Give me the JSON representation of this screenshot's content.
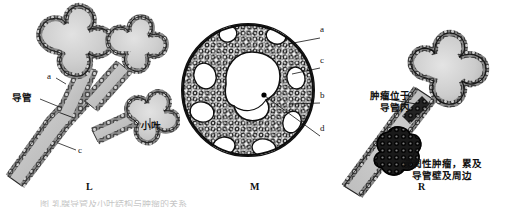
{
  "figure": {
    "title_caption": "图     乳腺导管及小叶结构与肿瘤的关系",
    "background_color": "#ffffff",
    "ink_color": "#1a1a1a"
  },
  "panels": [
    {
      "id": "L",
      "letter": "L",
      "description": "正常乳腺小叶与导管结构",
      "labels": [
        {
          "key": "duct",
          "text": "导管",
          "type": "chinese"
        },
        {
          "key": "lobule",
          "text": "小叶",
          "type": "chinese"
        },
        {
          "key": "a",
          "text": "a",
          "type": "letter"
        },
        {
          "key": "c",
          "text": "c",
          "type": "letter"
        }
      ]
    },
    {
      "id": "M",
      "letter": "M",
      "description": "导管横断面，腔内充满肿瘤细胞（筛状型）",
      "labels": [
        {
          "key": "a",
          "text": "a",
          "type": "letter"
        },
        {
          "key": "c",
          "text": "c",
          "type": "letter"
        },
        {
          "key": "b",
          "text": "b",
          "type": "letter"
        },
        {
          "key": "d",
          "text": "d",
          "type": "letter"
        }
      ]
    },
    {
      "id": "R",
      "letter": "R",
      "description": "肿瘤自导管内向导管壁外浸润",
      "labels": [
        {
          "key": "intraductal",
          "text": "肿瘤位于\n导管内",
          "line1": "肿瘤位于",
          "line2": "导管内",
          "type": "chinese"
        },
        {
          "key": "invasive",
          "line1": "浸润性肿瘤，累及",
          "line2": "导管壁及周边",
          "type": "chinese"
        }
      ]
    }
  ],
  "labels": {
    "duct_L": "导管",
    "lobule_L": "小叶",
    "a_L": "a",
    "c_L": "c",
    "a_M": "a",
    "c_M": "c",
    "b_M": "b",
    "d_M": "d",
    "intraductal_line1": "肿瘤位于",
    "intraductal_line2": "导管内",
    "invasive_line1": "浸润性肿瘤，累及",
    "invasive_line2": "导管壁及周边",
    "letter_L": "L",
    "letter_M": "M",
    "letter_R": "R"
  }
}
